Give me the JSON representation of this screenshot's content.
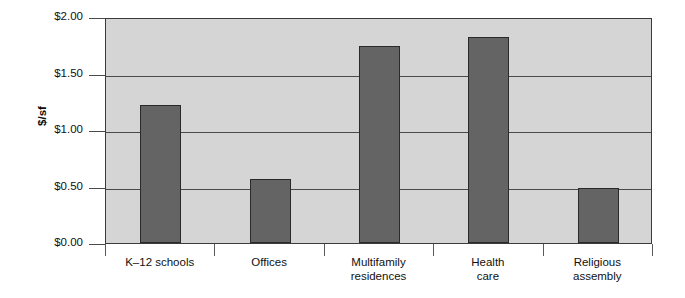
{
  "chart_data": {
    "type": "bar",
    "title": "",
    "xlabel": "",
    "ylabel": "$/sf",
    "categories": [
      "K–12 schools",
      "Multifamily residences",
      "Health care",
      "Religious assembly",
      "Offices"
    ],
    "category_labels": [
      {
        "line1": "K–12 schools",
        "line2": ""
      },
      {
        "line1": "Offices",
        "line2": ""
      },
      {
        "line1": "Multifamily",
        "line2": "residences"
      },
      {
        "line1": "Health",
        "line2": "care"
      },
      {
        "line1": "Religious",
        "line2": "assembly"
      }
    ],
    "values": [
      1.22,
      0.57,
      1.74,
      1.82,
      0.49
    ],
    "ylim": [
      0.0,
      2.0
    ],
    "ytick_values": [
      2.0,
      1.5,
      1.0,
      0.5,
      0.0
    ],
    "ytick_labels": [
      "$2.00",
      "$1.50",
      "$1.00",
      "$0.50",
      "$0.00"
    ],
    "grid": true,
    "legend": false,
    "colors": {
      "bar_fill": "#646464",
      "bar_stroke": "#2a2a2a",
      "plot_background": "#d5d5d5",
      "gridline": "#4a4a4a",
      "axis": "#3b3b3b",
      "text": "#111111",
      "page_background": "#ffffff"
    }
  }
}
